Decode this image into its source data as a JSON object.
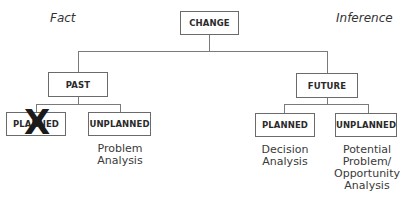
{
  "diagram": {
    "side_labels": {
      "left": "Fact",
      "right": "Inference"
    },
    "root": {
      "label": "CHANGE"
    },
    "branches": [
      {
        "label": "PAST",
        "children": [
          {
            "label": "PLANNED",
            "crossed_out": true,
            "description": ""
          },
          {
            "label": "UNPLANNED",
            "crossed_out": false,
            "description_lines": [
              "Problem",
              "Analysis"
            ]
          }
        ]
      },
      {
        "label": "FUTURE",
        "children": [
          {
            "label": "PLANNED",
            "crossed_out": false,
            "description_lines": [
              "Decision",
              "Analysis"
            ]
          },
          {
            "label": "UNPLANNED",
            "crossed_out": false,
            "description_lines": [
              "Potential",
              "Problem/",
              "Opportunity",
              "Analysis"
            ]
          }
        ]
      }
    ],
    "cross_mark": "X"
  }
}
